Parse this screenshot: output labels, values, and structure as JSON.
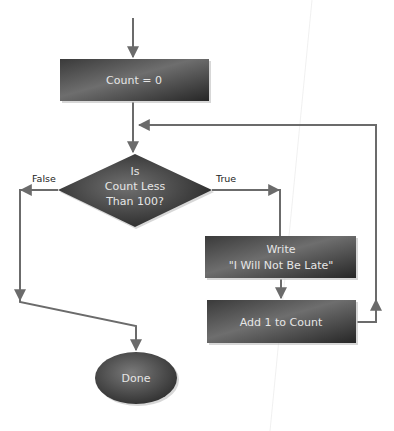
{
  "diagram": {
    "type": "flowchart",
    "colors": {
      "node_fill_dark": "#2e2e2e",
      "node_fill_light": "#6a6a6a",
      "node_text": "#e6e6e6",
      "connector": "#6b6b6b",
      "label_text": "#222222",
      "background": "#ffffff"
    },
    "nodes": {
      "init": {
        "shape": "rectangle",
        "label": "Count = 0"
      },
      "decision": {
        "shape": "diamond",
        "lines": [
          "Is",
          "Count Less",
          "Than 100?"
        ]
      },
      "write": {
        "shape": "rectangle",
        "lines": [
          "Write",
          "\"I Will Not Be Late\""
        ]
      },
      "increment": {
        "shape": "rectangle",
        "label": "Add 1 to Count"
      },
      "done": {
        "shape": "ellipse",
        "label": "Done"
      }
    },
    "edge_labels": {
      "false": "False",
      "true": "True"
    },
    "edges": [
      {
        "from": "start",
        "to": "init"
      },
      {
        "from": "init",
        "to": "decision"
      },
      {
        "from": "decision",
        "to": "write",
        "label": "True"
      },
      {
        "from": "decision",
        "to": "done",
        "label": "False"
      },
      {
        "from": "write",
        "to": "increment"
      },
      {
        "from": "increment",
        "to": "decision",
        "note": "loop back"
      }
    ]
  }
}
